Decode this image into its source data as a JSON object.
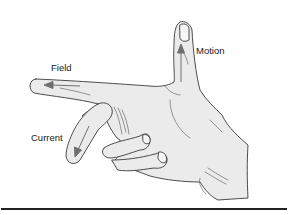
{
  "labels": {
    "field": "Field",
    "motion": "Motion",
    "current": "Current"
  },
  "colors": {
    "skin": "#ebebeb",
    "outline": "#3a3a3a",
    "arrow": "#6f6f6f",
    "text": "#1a1a1a",
    "rule": "#222222"
  }
}
